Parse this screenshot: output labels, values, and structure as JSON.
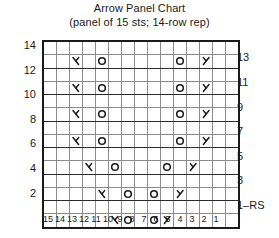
{
  "header": {
    "title": "Arrow Panel Chart",
    "subtitle": "(panel of 15 sts; 14-row rep)"
  },
  "legend_symbols": {
    "yo": "O",
    "k2tog": "left-leaning-decrease",
    "ssk": "right-leaning-decrease",
    "blank": ""
  },
  "axis": {
    "row_labels_left": [
      "14",
      "12",
      "10",
      "8",
      "6",
      "4",
      "2"
    ],
    "row_labels_right": [
      "13",
      "11",
      "9",
      "7",
      "5",
      "3",
      "1–RS"
    ],
    "column_labels": [
      "15",
      "14",
      "13",
      "12",
      "11",
      "10",
      "9",
      "8",
      "7",
      "6",
      "5",
      "4",
      "3",
      "2",
      "1"
    ]
  },
  "chart_data": {
    "type": "table",
    "title": "Arrow Panel Chart",
    "subtitle": "(panel of 15 sts; 14-row rep)",
    "stitches": 15,
    "rows": 14,
    "reading_direction": "right-to-left on RS rows",
    "xlabel": "",
    "ylabel": "",
    "grid": true,
    "legend_position": "none",
    "column_numbers": [
      15,
      14,
      13,
      12,
      11,
      10,
      9,
      8,
      7,
      6,
      5,
      4,
      3,
      2,
      1
    ],
    "row_numbers_odd_right": [
      13,
      11,
      9,
      7,
      5,
      3,
      1
    ],
    "row_numbers_even_left": [
      14,
      12,
      10,
      8,
      6,
      4,
      2
    ],
    "cell_symbols": {
      "O": "yo",
      "L": "k2tog",
      "R": "ssk",
      "": "knit"
    },
    "cells": [
      {
        "row": 14,
        "label_side": "left",
        "symbols": []
      },
      {
        "row": 13,
        "label_side": "right",
        "symbols": [
          {
            "col": 13,
            "sym": "L"
          },
          {
            "col": 11,
            "sym": "O"
          },
          {
            "col": 5,
            "sym": "O"
          },
          {
            "col": 3,
            "sym": "R"
          }
        ]
      },
      {
        "row": 12,
        "label_side": "left",
        "symbols": []
      },
      {
        "row": 11,
        "label_side": "right",
        "symbols": [
          {
            "col": 13,
            "sym": "L"
          },
          {
            "col": 11,
            "sym": "O"
          },
          {
            "col": 5,
            "sym": "O"
          },
          {
            "col": 3,
            "sym": "R"
          }
        ]
      },
      {
        "row": 10,
        "label_side": "left",
        "symbols": []
      },
      {
        "row": 9,
        "label_side": "right",
        "symbols": [
          {
            "col": 13,
            "sym": "L"
          },
          {
            "col": 11,
            "sym": "O"
          },
          {
            "col": 5,
            "sym": "O"
          },
          {
            "col": 3,
            "sym": "R"
          }
        ]
      },
      {
        "row": 8,
        "label_side": "left",
        "symbols": []
      },
      {
        "row": 7,
        "label_side": "right",
        "symbols": [
          {
            "col": 13,
            "sym": "L"
          },
          {
            "col": 11,
            "sym": "O"
          },
          {
            "col": 5,
            "sym": "O"
          },
          {
            "col": 3,
            "sym": "R"
          }
        ]
      },
      {
        "row": 6,
        "label_side": "left",
        "symbols": []
      },
      {
        "row": 5,
        "label_side": "right",
        "symbols": [
          {
            "col": 12,
            "sym": "L"
          },
          {
            "col": 10,
            "sym": "O"
          },
          {
            "col": 6,
            "sym": "O"
          },
          {
            "col": 4,
            "sym": "R"
          }
        ]
      },
      {
        "row": 4,
        "label_side": "left",
        "symbols": []
      },
      {
        "row": 3,
        "label_side": "right",
        "symbols": [
          {
            "col": 11,
            "sym": "L"
          },
          {
            "col": 9,
            "sym": "O"
          },
          {
            "col": 7,
            "sym": "O"
          },
          {
            "col": 5,
            "sym": "R"
          }
        ]
      },
      {
        "row": 2,
        "label_side": "left",
        "symbols": []
      },
      {
        "row": 1,
        "label_side": "right",
        "symbols": [
          {
            "col": 10,
            "sym": "L"
          },
          {
            "col": 9,
            "sym": "O"
          },
          {
            "col": 7,
            "sym": "O"
          },
          {
            "col": 6,
            "sym": "R"
          }
        ]
      }
    ]
  }
}
